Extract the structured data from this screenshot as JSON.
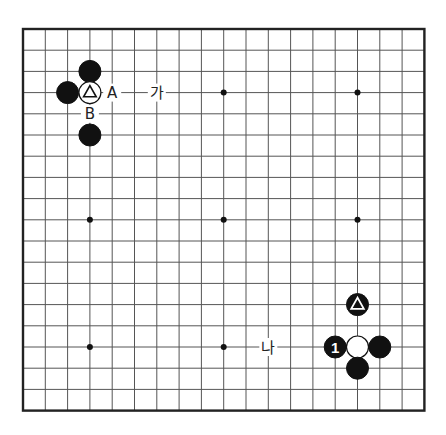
{
  "board": {
    "size": 19,
    "origin_x": 23,
    "origin_y": 29,
    "spacing_x": 22.3,
    "spacing_y": 21.2,
    "stone_radius": 11,
    "colors": {
      "line": "#555555",
      "edge": "#222222",
      "black": "#111111",
      "white": "#ffffff"
    },
    "hoshi": [
      [
        3,
        3
      ],
      [
        9,
        3
      ],
      [
        15,
        3
      ],
      [
        3,
        9
      ],
      [
        9,
        9
      ],
      [
        15,
        9
      ],
      [
        3,
        15
      ],
      [
        9,
        15
      ],
      [
        15,
        15
      ]
    ]
  },
  "stones": [
    {
      "color": "black",
      "col": 3,
      "row": 2,
      "mark": ""
    },
    {
      "color": "black",
      "col": 2,
      "row": 3,
      "mark": ""
    },
    {
      "color": "white",
      "col": 3,
      "row": 3,
      "mark": "triangle"
    },
    {
      "color": "black",
      "col": 3,
      "row": 5,
      "mark": ""
    },
    {
      "color": "black",
      "col": 15,
      "row": 13,
      "mark": "triangle"
    },
    {
      "color": "black",
      "col": 14,
      "row": 15,
      "mark": "1"
    },
    {
      "color": "white",
      "col": 15,
      "row": 15,
      "mark": ""
    },
    {
      "color": "black",
      "col": 16,
      "row": 15,
      "mark": ""
    },
    {
      "color": "black",
      "col": 15,
      "row": 16,
      "mark": ""
    }
  ],
  "labels": [
    {
      "text": "A",
      "col": 4,
      "row": 3
    },
    {
      "text": "가",
      "col": 6,
      "row": 3
    },
    {
      "text": "B",
      "col": 3,
      "row": 4
    },
    {
      "text": "나",
      "col": 11,
      "row": 15
    }
  ]
}
